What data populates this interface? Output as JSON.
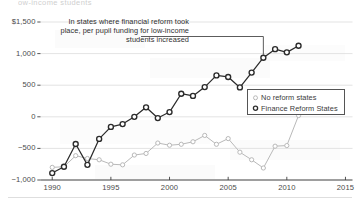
{
  "top_fragment": "ow-income students",
  "annotation": {
    "lines": [
      "In states where financial reform took",
      "place, per pupil funding for low-income",
      "students increased"
    ],
    "full_text": "In states where financial reform took place, per pupil funding for low-income students increased",
    "leader_target_year": 2008,
    "leader_target_value": 935
  },
  "legend": {
    "position": "inside-right-middle",
    "entries": [
      {
        "label": "No reform states",
        "marker": "open-circle-light",
        "color": "#b9b9b9"
      },
      {
        "label": "Finance Reform States",
        "marker": "open-circle-dark",
        "color": "#2b2b2b"
      }
    ]
  },
  "chart_data": {
    "type": "line",
    "title": "",
    "subtitle": "",
    "xlabel": "",
    "ylabel": "",
    "xlim": [
      1989,
      2015.6
    ],
    "ylim": [
      -1000,
      1500
    ],
    "grid": true,
    "grid_axis": "y",
    "xticks": [
      "1990",
      "1995",
      "2000",
      "2005",
      "2010",
      "2015"
    ],
    "xtick_values": [
      1990,
      1995,
      2000,
      2005,
      2010,
      2015
    ],
    "yticks": [
      "$1,500",
      "1,000",
      "500",
      "0",
      "−500",
      "−1,000"
    ],
    "ytick_values": [
      1500,
      1000,
      500,
      0,
      -500,
      -1000
    ],
    "x": [
      1990,
      1991,
      1992,
      1993,
      1994,
      1995,
      1996,
      1997,
      1998,
      1999,
      2000,
      2001,
      2002,
      2003,
      2004,
      2005,
      2006,
      2007,
      2008,
      2009,
      2010,
      2011
    ],
    "series": [
      {
        "name": "No reform states",
        "color": "#b9b9b9",
        "marker": "open-circle",
        "values": [
          -800,
          -790,
          -615,
          -660,
          -680,
          -750,
          -760,
          -605,
          -580,
          -415,
          -450,
          -435,
          -395,
          -295,
          -435,
          -345,
          -560,
          -680,
          -810,
          -465,
          -455,
          20
        ]
      },
      {
        "name": "Finance Reform States",
        "color": "#2b2b2b",
        "marker": "open-circle",
        "values": [
          -890,
          -790,
          -430,
          -760,
          -350,
          -160,
          -115,
          0,
          150,
          -20,
          75,
          365,
          330,
          470,
          655,
          630,
          465,
          700,
          935,
          1070,
          1020,
          1125
        ]
      }
    ]
  }
}
